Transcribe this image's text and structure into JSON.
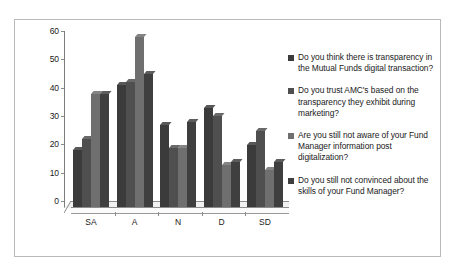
{
  "chart_data": {
    "type": "bar",
    "title": "",
    "xlabel": "",
    "ylabel": "",
    "ylim": [
      0,
      60
    ],
    "yticks": [
      0,
      10,
      20,
      30,
      40,
      50,
      60
    ],
    "grid": false,
    "legend_position": "right",
    "categories": [
      "SA",
      "A",
      "N",
      "D",
      "SD"
    ],
    "series": [
      {
        "name": "Do you think there is transparency in the Mutual Funds digital transaction?",
        "color": "#3b3b3b",
        "values": [
          20,
          43,
          29,
          35,
          22
        ]
      },
      {
        "name": "Do you trust AMC's based on the transparency they exhibit during marketing?",
        "color": "#4f4f4f",
        "values": [
          24,
          44,
          21,
          32,
          27
        ]
      },
      {
        "name": "Are you still not aware of your Fund Manager information post digitalization?",
        "color": "#6f6f6f",
        "values": [
          40,
          60,
          21,
          15,
          13
        ]
      },
      {
        "name": "Do you still not convinced about the skills of your Fund Manager?",
        "color": "#3f3f3f",
        "values": [
          40,
          47,
          30,
          16,
          16
        ]
      }
    ]
  },
  "axis": {
    "tick_0": "0",
    "tick_10": "10",
    "tick_20": "20",
    "tick_30": "30",
    "tick_40": "40",
    "tick_50": "50",
    "tick_60": "60"
  },
  "legend": {
    "item_1": "Do you think there is transparency in the Mutual Funds digital transaction?",
    "item_2": "Do you trust AMC's based on the transparency they exhibit during marketing?",
    "item_3": "Are you still not aware of your Fund Manager information post digitalization?",
    "item_4": "Do you still not convinced about the skills of your Fund Manager?"
  },
  "categories": {
    "c0": "SA",
    "c1": "A",
    "c2": "N",
    "c3": "D",
    "c4": "SD"
  }
}
